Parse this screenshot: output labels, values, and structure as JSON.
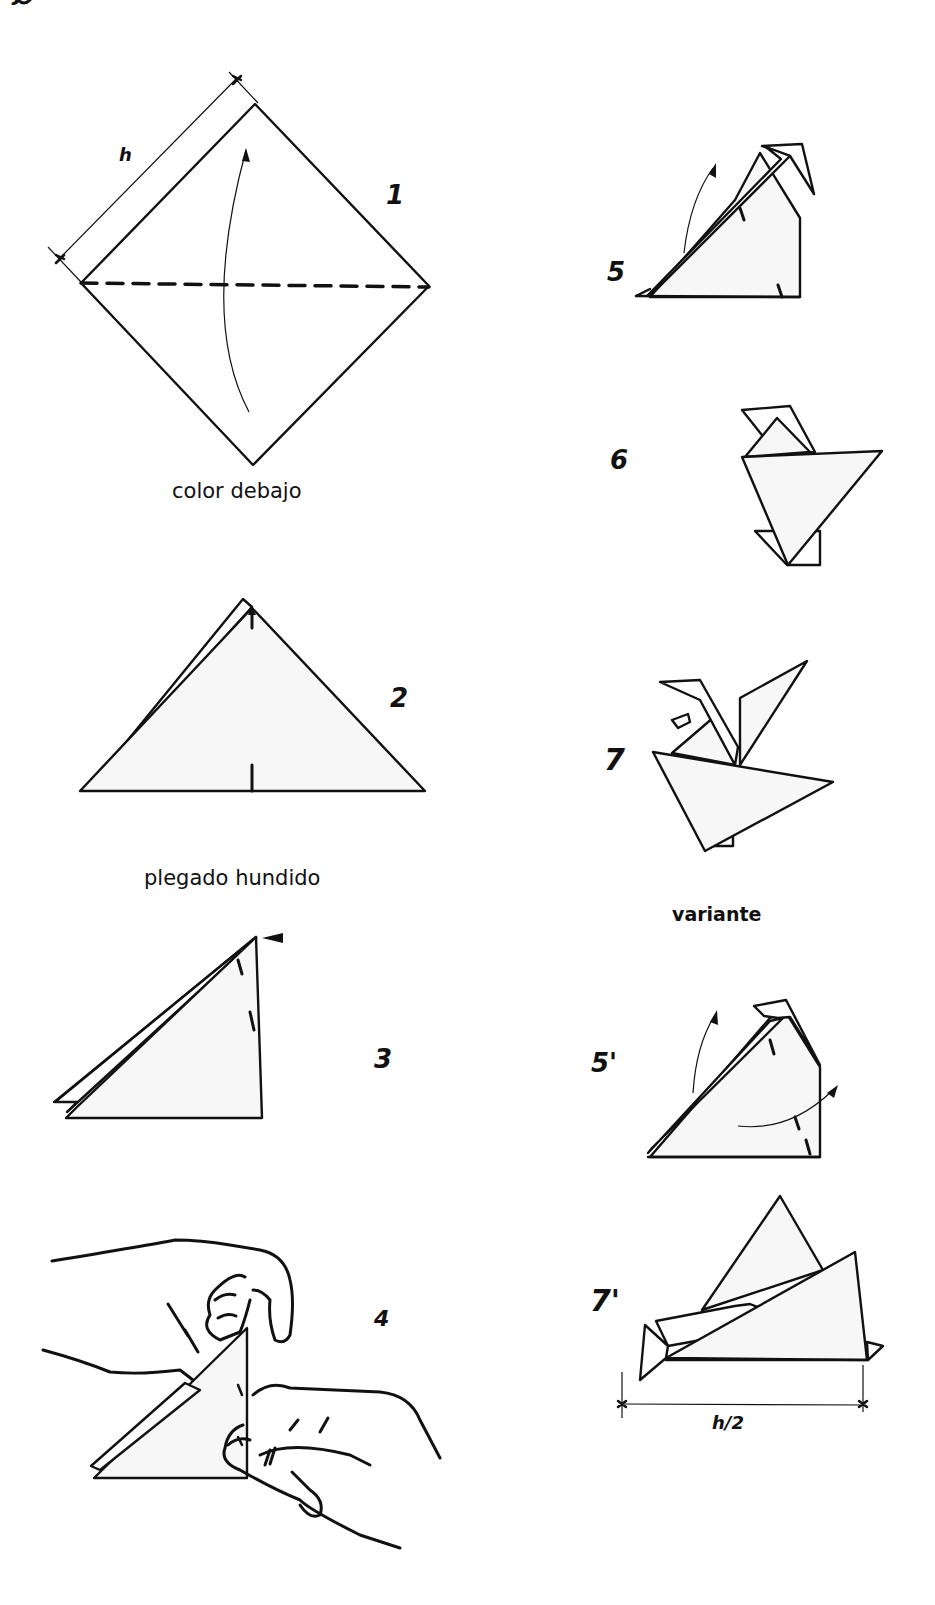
{
  "figure": {
    "corner_mark": "ɟ",
    "steps": [
      {
        "id": "1",
        "label": "1",
        "caption": "color debajo",
        "dimension": "h"
      },
      {
        "id": "2",
        "label": "2"
      },
      {
        "id": "3",
        "label": "3",
        "caption_above": "plegado hundido"
      },
      {
        "id": "4",
        "label": "4"
      },
      {
        "id": "5",
        "label": "5"
      },
      {
        "id": "6",
        "label": "6"
      },
      {
        "id": "7",
        "label": "7"
      },
      {
        "id": "5p",
        "label": "5'"
      },
      {
        "id": "7p",
        "label": "7'",
        "dimension": "h/2"
      }
    ],
    "variant_heading": "variante"
  },
  "colors": {
    "ink": "#111111",
    "paper": "#f7f7f7",
    "background": "#ffffff"
  }
}
